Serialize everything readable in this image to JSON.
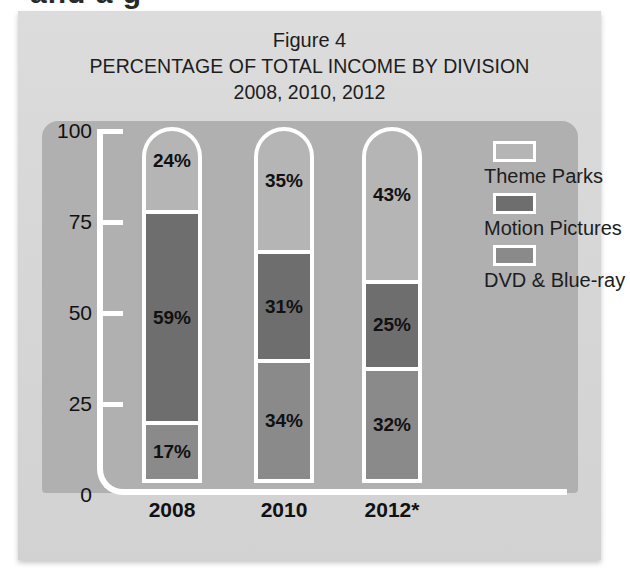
{
  "page": {
    "bleed_text": "and a g"
  },
  "figure": {
    "figure_number": "Figure 4",
    "title": "PERCENTAGE OF TOTAL INCOME BY DIVISION",
    "subtitle": "2008, 2010, 2012"
  },
  "colors": {
    "background_panel": "#d7d7d7",
    "plot_panel": "#b0b0b0",
    "axis_line": "#ffffff",
    "theme_parks": "#b5b5b5",
    "motion_pictures": "#6e6e6e",
    "dvd_bluray": "#8a8a8a",
    "text": "#1d1d1d"
  },
  "legend": {
    "items": [
      {
        "label": "Theme Parks",
        "color": "#b5b5b5",
        "swatch_name": "legend-swatch-theme-parks"
      },
      {
        "label": "Motion Pictures",
        "color": "#6e6e6e",
        "swatch_name": "legend-swatch-motion-pictures"
      },
      {
        "label": "DVD & Blue-ray",
        "color": "#8a8a8a",
        "swatch_name": "legend-swatch-dvd-bluray"
      }
    ]
  },
  "axis": {
    "y_ticks": [
      "100",
      "75",
      "50",
      "25",
      "0"
    ],
    "x_labels": [
      "2008",
      "2010",
      "2012*"
    ]
  },
  "bars": [
    {
      "category": "2008",
      "segments": [
        {
          "series": "Theme Parks",
          "value": 24,
          "label": "24%"
        },
        {
          "series": "Motion Pictures",
          "value": 59,
          "label": "59%"
        },
        {
          "series": "DVD & Blue-ray",
          "value": 17,
          "label": "17%"
        }
      ]
    },
    {
      "category": "2010",
      "segments": [
        {
          "series": "Theme Parks",
          "value": 35,
          "label": "35%"
        },
        {
          "series": "Motion Pictures",
          "value": 31,
          "label": "31%"
        },
        {
          "series": "DVD & Blue-ray",
          "value": 34,
          "label": "34%"
        }
      ]
    },
    {
      "category": "2012*",
      "segments": [
        {
          "series": "Theme Parks",
          "value": 43,
          "label": "43%"
        },
        {
          "series": "Motion Pictures",
          "value": 25,
          "label": "25%"
        },
        {
          "series": "DVD & Blue-ray",
          "value": 32,
          "label": "32%"
        }
      ]
    }
  ],
  "chart_data": {
    "type": "bar",
    "subtype": "stacked-100-percent",
    "title": "PERCENTAGE OF TOTAL INCOME BY DIVISION",
    "subtitle": "2008, 2010, 2012",
    "figure_label": "Figure 4",
    "categories": [
      "2008",
      "2010",
      "2012*"
    ],
    "series": [
      {
        "name": "Theme Parks",
        "values": [
          24,
          35,
          43
        ],
        "color": "#b5b5b5"
      },
      {
        "name": "Motion Pictures",
        "values": [
          59,
          31,
          25
        ],
        "color": "#6e6e6e"
      },
      {
        "name": "DVD & Blue-ray",
        "values": [
          17,
          34,
          32
        ],
        "color": "#8a8a8a"
      }
    ],
    "stack_order_top_to_bottom": [
      "Theme Parks",
      "Motion Pictures",
      "DVD & Blue-ray"
    ],
    "xlabel": "",
    "ylabel": "",
    "ylim": [
      0,
      100
    ],
    "yticks": [
      0,
      25,
      50,
      75,
      100
    ],
    "tick_labels": [
      "0",
      "25",
      "50",
      "75",
      "100"
    ],
    "grid": false,
    "legend_position": "right",
    "data_labels": true,
    "units": "percent"
  }
}
